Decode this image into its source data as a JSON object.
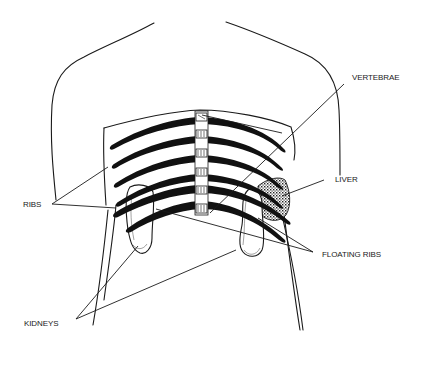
{
  "diagram": {
    "labels": {
      "vertebrae": "VERTEBRAE",
      "liver": "LIVER",
      "ribs": "RIBS",
      "floating_ribs": "FLOATING RIBS",
      "kidneys": "KIDNEYS"
    },
    "rib_count": 6,
    "vertebra_count": 6,
    "colors": {
      "line": "#1a1a1a",
      "rib": "#111111",
      "background": "#ffffff"
    }
  }
}
